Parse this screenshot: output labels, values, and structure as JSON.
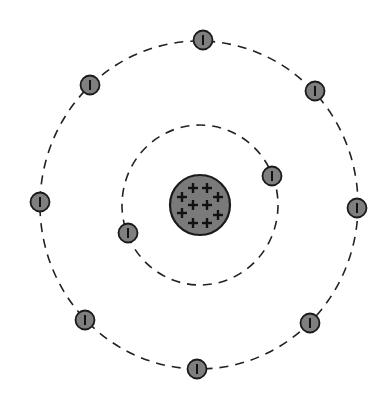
{
  "diagram": {
    "type": "bohr-atom-model",
    "colors": {
      "background": "#ffffff",
      "orbit": "#222222",
      "nucleus_fill": "#7a7a7a",
      "nucleus_stroke": "#1a1a1a",
      "electron_fill": "#7f7f7f",
      "electron_stroke": "#1a1a1a",
      "symbol": "#111111"
    },
    "nucleus": {
      "cx": 200,
      "cy": 205,
      "r": 30,
      "charge_symbol": "+",
      "protons": [
        {
          "x": 193,
          "y": 188
        },
        {
          "x": 207,
          "y": 188
        },
        {
          "x": 182,
          "y": 197
        },
        {
          "x": 218,
          "y": 197
        },
        {
          "x": 193,
          "y": 205
        },
        {
          "x": 207,
          "y": 205
        },
        {
          "x": 182,
          "y": 213
        },
        {
          "x": 218,
          "y": 215
        },
        {
          "x": 193,
          "y": 223
        },
        {
          "x": 207,
          "y": 223
        }
      ]
    },
    "orbits": [
      {
        "name": "inner-shell",
        "cx": 200,
        "cy": 205,
        "rx": 78,
        "ry": 80,
        "electrons": [
          {
            "x": 272,
            "y": 176
          },
          {
            "x": 128,
            "y": 233
          }
        ]
      },
      {
        "name": "outer-shell",
        "cx": 199,
        "cy": 205,
        "rx": 159,
        "ry": 164,
        "electrons": [
          {
            "x": 203,
            "y": 40
          },
          {
            "x": 315,
            "y": 91
          },
          {
            "x": 357,
            "y": 208
          },
          {
            "x": 310,
            "y": 323
          },
          {
            "x": 197,
            "y": 369
          },
          {
            "x": 85,
            "y": 320
          },
          {
            "x": 40,
            "y": 202
          },
          {
            "x": 90,
            "y": 85
          }
        ]
      }
    ],
    "electron": {
      "r": 9.5,
      "charge_symbol": "−"
    },
    "counts": {
      "protons": 10,
      "electrons": 10,
      "shells": 2
    }
  }
}
